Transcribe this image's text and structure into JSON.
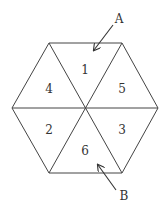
{
  "diagram": {
    "type": "hexagon-net",
    "triangles": [
      {
        "id": "t1",
        "label": "1"
      },
      {
        "id": "t2",
        "label": "2"
      },
      {
        "id": "t3",
        "label": "3"
      },
      {
        "id": "t4",
        "label": "4"
      },
      {
        "id": "t5",
        "label": "5"
      },
      {
        "id": "t6",
        "label": "6"
      }
    ],
    "arrows": [
      {
        "id": "arrow-a",
        "label": "A",
        "points_to": "1"
      },
      {
        "id": "arrow-b",
        "label": "B",
        "points_to": "6"
      }
    ],
    "colors": {
      "stroke": "#444444",
      "text": "#333333",
      "background": "#ffffff"
    }
  }
}
